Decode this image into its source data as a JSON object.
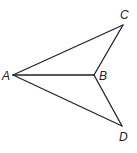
{
  "figure": {
    "type": "geometry-figure",
    "colors": {
      "stroke": "#222222",
      "background": "#ffffff"
    },
    "points": [
      {
        "id": "A",
        "label": "A",
        "x": 13,
        "y": 75,
        "label_x": 2,
        "label_y": 80
      },
      {
        "id": "B",
        "label": "B",
        "x": 94,
        "y": 75,
        "label_x": 99,
        "label_y": 80
      },
      {
        "id": "C",
        "label": "C",
        "x": 123,
        "y": 25,
        "label_x": 120,
        "label_y": 19
      },
      {
        "id": "D",
        "label": "D",
        "x": 122,
        "y": 126,
        "label_x": 119,
        "label_y": 141
      }
    ],
    "segments": [
      {
        "from": "A",
        "to": "C"
      },
      {
        "from": "A",
        "to": "B"
      },
      {
        "from": "A",
        "to": "D"
      },
      {
        "from": "B",
        "to": "C"
      },
      {
        "from": "B",
        "to": "D"
      }
    ]
  }
}
